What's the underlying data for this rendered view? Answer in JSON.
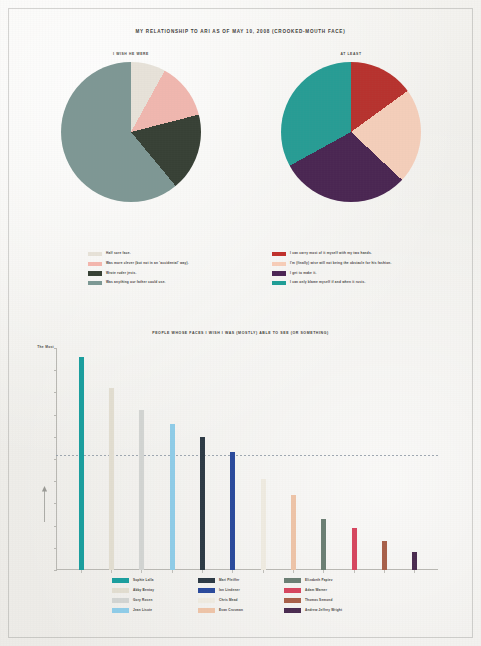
{
  "page": {
    "title": "MY RELATIONSHIP TO ARI AS OF MAY 10, 2008 (CROOKED-MOUTH FACE)",
    "paper_color": "#f2f1ee",
    "ink_color": "#3d3b38"
  },
  "chart_data": [
    {
      "type": "pie",
      "title": "I WISH HE WERE",
      "id": "pie-left",
      "labels": [
        "Half sore face.",
        "Was more clever (but not in an 'accidental' way).",
        "Wrote ruder jests.",
        "Was anything our father could use."
      ],
      "values": [
        8,
        13,
        18,
        61
      ],
      "colors": [
        "#e7e2d8",
        "#f4b6ad",
        "#364034",
        "#7c9894"
      ],
      "legend_position": "below"
    },
    {
      "type": "pie",
      "title": "AT LEAST",
      "id": "pie-right",
      "labels": [
        "I can carry most of it myself with my two hands.",
        "I'm (finally) wise will not being the obstacle for his fashion.",
        "I get to make it.",
        "I can only blame myself if and when it rusts."
      ],
      "values": [
        15,
        22,
        30,
        33
      ],
      "colors": [
        "#c0302b",
        "#f7cdb8",
        "#4c2555",
        "#1f9e96"
      ],
      "legend_position": "below"
    },
    {
      "type": "bar",
      "id": "bar-main",
      "title": "PEOPLE WHOSE FACES I WISH I WAS (MOSTLY) ABLE TO SEE (OR SOMETHING)",
      "ylabel_top": "The Most",
      "ylabel_arrow": "↑",
      "xlabel": "",
      "ylim": [
        0,
        100
      ],
      "grid": false,
      "reference_line": 52,
      "categories": [
        "Sophie Lalla",
        "Abby Bentay",
        "Gory Rosen",
        "Jean Lisote",
        "Mari Pfeiffer",
        "Ian Lindener",
        "Chris Mead",
        "Evan Crosman",
        "Elizabeth Papiev",
        "Adam Warner",
        "Thomas Semond",
        "Andrew Jeffrey Wright"
      ],
      "values": [
        96,
        82,
        72,
        66,
        60,
        53,
        41,
        34,
        23,
        19,
        13,
        8
      ],
      "colors": [
        "#1a9e9e",
        "#e2ddd0",
        "#d2d4d2",
        "#8fcce8",
        "#2d3a45",
        "#2a4a9c",
        "#efebe1",
        "#eec4a8",
        "#6b7f74",
        "#d6465f",
        "#a8604a",
        "#4a2b50"
      ],
      "legend_columns": [
        [
          {
            "name": "Sophie Lalla",
            "color": "#1a9e9e"
          },
          {
            "name": "Abby Bentay",
            "color": "#e2ddd0"
          },
          {
            "name": "Gory Rosen",
            "color": "#d2d4d2"
          },
          {
            "name": "Jean Lisote",
            "color": "#8fcce8"
          }
        ],
        [
          {
            "name": "Mari Pfeiffer",
            "color": "#2d3a45"
          },
          {
            "name": "Ian Lindener",
            "color": "#2a4a9c"
          },
          {
            "name": "Chris Mead",
            "color": "#efebe1"
          },
          {
            "name": "Evan Crosman",
            "color": "#eec4a8"
          }
        ],
        [
          {
            "name": "Elizabeth Papiev",
            "color": "#6b7f74"
          },
          {
            "name": "Adam Warner",
            "color": "#d6465f"
          },
          {
            "name": "Thomas Semond",
            "color": "#a8604a"
          },
          {
            "name": "Andrew Jeffrey Wright",
            "color": "#4a2b50"
          }
        ]
      ]
    }
  ]
}
